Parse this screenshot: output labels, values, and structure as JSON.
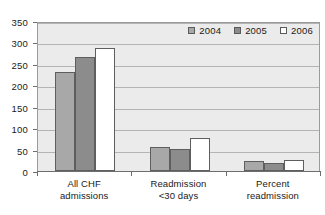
{
  "chart_data": {
    "type": "bar",
    "title": "",
    "subtitle": "",
    "xlabel": "",
    "ylabel": "",
    "ylim": [
      0,
      350
    ],
    "yticks": [
      0,
      50,
      100,
      150,
      200,
      250,
      300,
      350
    ],
    "ytick_labels": [
      "0",
      "50",
      "100",
      "150",
      "200",
      "250",
      "300",
      "350"
    ],
    "grid": true,
    "legend_position": "top-right",
    "categories": [
      "All CHF admissions",
      "Readmission <30 days",
      "Percent readmission"
    ],
    "category_lines": [
      [
        "All CHF",
        "admissions"
      ],
      [
        "Readmission",
        "<30 days"
      ],
      [
        "Percent",
        "readmission"
      ]
    ],
    "series": [
      {
        "name": "2004",
        "color": "#a8a8a8",
        "values": [
          230,
          55,
          24
        ]
      },
      {
        "name": "2005",
        "color": "#8c8c8c",
        "values": [
          265,
          52,
          19
        ]
      },
      {
        "name": "2006",
        "color": "#ffffff",
        "values": [
          288,
          76,
          26
        ]
      }
    ]
  },
  "legend": {
    "items": [
      {
        "label": "2004",
        "color": "#a8a8a8"
      },
      {
        "label": "2005",
        "color": "#8c8c8c"
      },
      {
        "label": "2006",
        "color": "#ffffff"
      }
    ]
  },
  "colors": {
    "plot_background": "#ebebeb",
    "gridline": "#b4b4b4",
    "axis": "#6e6e6e",
    "bar_border": "#5e5e5e",
    "text": "#1a1a1a",
    "page_background": "#ffffff"
  }
}
